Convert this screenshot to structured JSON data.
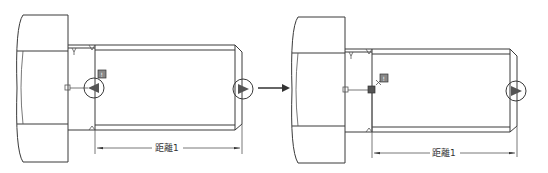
{
  "figure": {
    "colors": {
      "line": "#3a3a3a",
      "marker_fill": "#555555",
      "background": "#ffffff"
    }
  },
  "panels": [
    {
      "id": "before",
      "dimension_label": "距離1",
      "marker_badge": "!",
      "origin_x": 0
    },
    {
      "id": "after",
      "dimension_label": "距離1",
      "marker_badge": "!",
      "origin_x": 276
    }
  ],
  "transition": {
    "icon": "arrow-right-icon"
  }
}
